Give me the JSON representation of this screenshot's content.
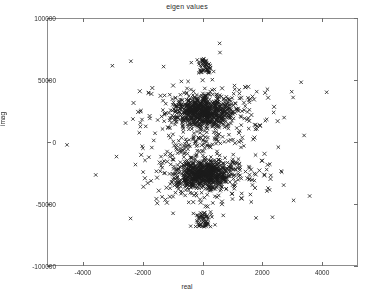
{
  "chart_data": {
    "type": "scatter",
    "title": "eigen values",
    "xlabel": "real",
    "ylabel": "imag",
    "xlim": [
      -5200,
      5200
    ],
    "ylim": [
      -100000,
      100000
    ],
    "xticks": [
      -4000,
      -2000,
      0,
      2000,
      4000
    ],
    "xticklabels": [
      "-4000",
      "-2000",
      "0",
      "2000",
      "4000"
    ],
    "yticks": [
      -100000,
      -50000,
      0,
      50000,
      100000
    ],
    "yticklabels": [
      "-100000",
      "-50000",
      "0",
      "50000",
      "100000"
    ],
    "grid": false,
    "legend": null,
    "marker": "x",
    "marker_color": "#1a1a1a",
    "series": [
      {
        "name": "eigenvalues",
        "description": "Complex eigenvalue spectrum clustered near real=0, forming two dense lobes at imag approx +/-25000 and two narrow vertical bands at imag approx +/-62000.",
        "clusters": [
          {
            "name": "upper-band",
            "center": [
              0,
              62000
            ],
            "real_spread": 140,
            "imag_range": [
              56000,
              68000
            ],
            "count": 60,
            "shape": "vertical-strip"
          },
          {
            "name": "upper-lobe",
            "center": [
              0,
              25000
            ],
            "real_spread": 900,
            "imag_spread": 11000,
            "count": 900,
            "shape": "dense-blob"
          },
          {
            "name": "origin-band",
            "center": [
              0,
              2000
            ],
            "real_spread": 500,
            "imag_range": [
              -3000,
              6000
            ],
            "count": 40,
            "shape": "sparse-cross"
          },
          {
            "name": "lower-lobe",
            "center": [
              0,
              -25000
            ],
            "real_spread": 900,
            "imag_spread": 11000,
            "count": 900,
            "shape": "dense-blob"
          },
          {
            "name": "lower-band",
            "center": [
              0,
              -62000
            ],
            "real_spread": 140,
            "imag_range": [
              -68000,
              -56000
            ],
            "count": 60,
            "shape": "vertical-strip"
          }
        ]
      }
    ]
  }
}
